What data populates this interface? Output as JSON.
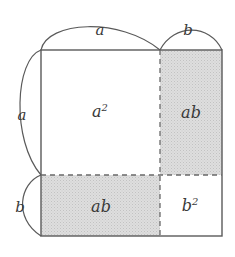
{
  "figure": {
    "background_color": "#ffffff",
    "line_color": "#4a4a4a",
    "shade_color": "#d8d8d8",
    "label_color": "#3a3a3a",
    "square": {
      "left": 41,
      "top": 50,
      "right": 222,
      "bottom": 236,
      "split_x": 160,
      "split_y": 175
    },
    "regions": [
      {
        "id": "top-left",
        "label": "a",
        "exponent": "2",
        "shaded": false,
        "cx": 100,
        "cy": 112
      },
      {
        "id": "top-right",
        "label": "ab",
        "exponent": "",
        "shaded": true,
        "cx": 191,
        "cy": 113
      },
      {
        "id": "bottom-left",
        "label": "ab",
        "exponent": "",
        "shaded": true,
        "cx": 101,
        "cy": 207
      },
      {
        "id": "bottom-right",
        "label": "b",
        "exponent": "2",
        "shaded": false,
        "cx": 190,
        "cy": 206
      }
    ],
    "dimensions": [
      {
        "id": "top-a",
        "label": "a",
        "cx": 100,
        "cy": 30
      },
      {
        "id": "top-b",
        "label": "b",
        "cx": 188,
        "cy": 30
      },
      {
        "id": "left-a",
        "label": "a",
        "cx": 22,
        "cy": 115
      },
      {
        "id": "left-b",
        "label": "b",
        "cx": 20,
        "cy": 207
      }
    ]
  }
}
